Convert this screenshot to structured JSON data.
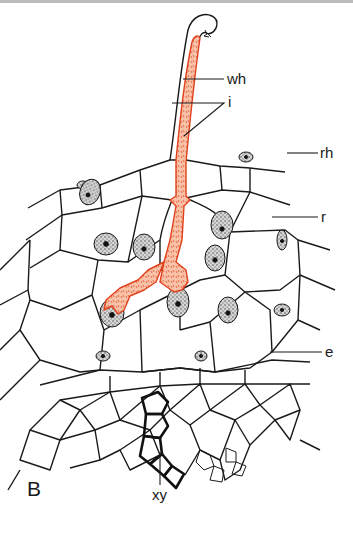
{
  "figure": {
    "panel_letter": "B",
    "colors": {
      "cell_walls": "#1a1a1a",
      "hypha_fill": "#f2a488",
      "hypha_outline": "#e0401c",
      "nucleus_fill": "#9a9a9a",
      "background": "#ffffff"
    },
    "labels": [
      {
        "id": "wh",
        "text": "wh"
      },
      {
        "id": "i",
        "text": "i"
      },
      {
        "id": "rh",
        "text": "rh"
      },
      {
        "id": "r",
        "text": "r"
      },
      {
        "id": "e",
        "text": "e"
      },
      {
        "id": "xy",
        "text": "xy"
      }
    ]
  }
}
